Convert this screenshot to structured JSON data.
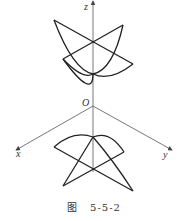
{
  "figure": {
    "axes": {
      "z_label": "z",
      "x_label": "x",
      "y_label": "y",
      "origin_label": "O"
    },
    "caption": {
      "prefix": "图",
      "number": "5-5-2"
    }
  }
}
